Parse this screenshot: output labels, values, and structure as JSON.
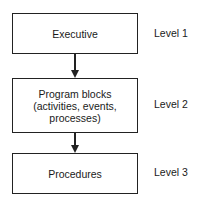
{
  "diagram": {
    "nodes": [
      {
        "label": "Executive",
        "level": "Level 1"
      },
      {
        "label": "Program blocks\n(activities, events,\nprocesses)",
        "level": "Level 2"
      },
      {
        "label": "Procedures",
        "level": "Level 3"
      }
    ],
    "edges": [
      {
        "from": "Executive",
        "to": "Program blocks"
      },
      {
        "from": "Program blocks",
        "to": "Procedures"
      }
    ]
  }
}
